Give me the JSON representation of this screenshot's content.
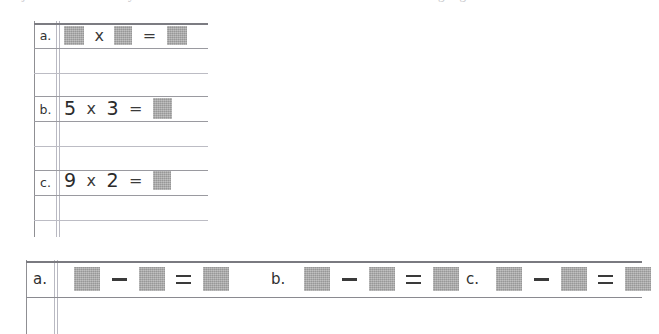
{
  "document": {
    "type": "scanned-math-worksheet",
    "top_cropped_text": "partially cropped line of text above worksheet",
    "redaction_color": "#a9a9a9",
    "rule_color": "#9a9aa0"
  },
  "top_block": {
    "name": "multiplication-exercises",
    "rows": [
      {
        "label": "a.",
        "parts": [
          {
            "kind": "redaction",
            "width": 20,
            "height": 19
          },
          {
            "kind": "operator",
            "text": "x"
          },
          {
            "kind": "redaction",
            "width": 18,
            "height": 19
          },
          {
            "kind": "operator",
            "text": "="
          },
          {
            "kind": "redaction",
            "width": 20,
            "height": 19
          }
        ]
      },
      {
        "label": "b.",
        "parts": [
          {
            "kind": "number",
            "text": "5"
          },
          {
            "kind": "operator",
            "text": "x"
          },
          {
            "kind": "number",
            "text": "3"
          },
          {
            "kind": "operator",
            "text": "="
          },
          {
            "kind": "redaction",
            "width": 19,
            "height": 21
          }
        ]
      },
      {
        "label": "c.",
        "parts": [
          {
            "kind": "number",
            "text": "9"
          },
          {
            "kind": "operator",
            "text": "x"
          },
          {
            "kind": "number",
            "text": "2"
          },
          {
            "kind": "operator",
            "text": "="
          },
          {
            "kind": "redaction",
            "width": 18,
            "height": 19
          }
        ]
      }
    ],
    "ruled_lines": [
      {
        "y": 3,
        "weight": "heavy"
      },
      {
        "y": 28,
        "weight": "normal"
      },
      {
        "y": 53,
        "weight": "light"
      },
      {
        "y": 76,
        "weight": "normal"
      },
      {
        "y": 101,
        "weight": "normal"
      },
      {
        "y": 126,
        "weight": "light"
      },
      {
        "y": 150,
        "weight": "normal"
      },
      {
        "y": 175,
        "weight": "normal"
      },
      {
        "y": 200,
        "weight": "light"
      }
    ]
  },
  "bottom_block": {
    "name": "subtraction-exercises",
    "items": [
      {
        "label": "a.",
        "parts": [
          {
            "kind": "redaction",
            "width": 26,
            "height": 24
          },
          {
            "kind": "operator",
            "text": "—"
          },
          {
            "kind": "redaction",
            "width": 26,
            "height": 24
          },
          {
            "kind": "operator",
            "text": "="
          },
          {
            "kind": "redaction",
            "width": 26,
            "height": 24
          }
        ]
      },
      {
        "label": "b.",
        "parts": [
          {
            "kind": "redaction",
            "width": 26,
            "height": 24
          },
          {
            "kind": "operator",
            "text": "—"
          },
          {
            "kind": "redaction",
            "width": 26,
            "height": 24
          },
          {
            "kind": "operator",
            "text": "="
          },
          {
            "kind": "redaction",
            "width": 26,
            "height": 24
          }
        ]
      },
      {
        "label": "c.",
        "parts": [
          {
            "kind": "redaction",
            "width": 26,
            "height": 24
          },
          {
            "kind": "operator",
            "text": "—"
          },
          {
            "kind": "redaction",
            "width": 26,
            "height": 24
          },
          {
            "kind": "operator",
            "text": "="
          },
          {
            "kind": "redaction",
            "width": 26,
            "height": 24
          }
        ]
      }
    ],
    "ruled_lines": [
      {
        "y": 3,
        "weight": "heavy"
      },
      {
        "y": 39,
        "weight": "normal"
      }
    ]
  },
  "labels": {
    "top_a": "a.",
    "top_b": "b.",
    "top_c": "c.",
    "bottom_a": "a.",
    "bottom_b": "b.",
    "bottom_c": "c."
  },
  "operators": {
    "times": "x",
    "equals": "=",
    "minus": "—"
  },
  "numbers": {
    "b_left": "5",
    "b_right": "3",
    "c_left": "9",
    "c_right": "2"
  }
}
